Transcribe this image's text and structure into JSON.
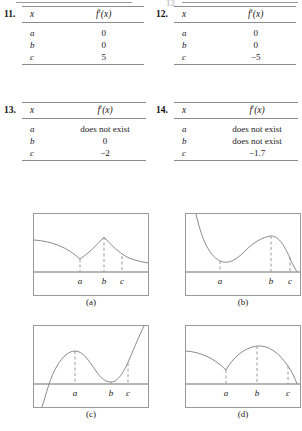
{
  "page": {
    "clipped_top_number": "12"
  },
  "exercises": [
    {
      "number": "11.",
      "columns": [
        "x",
        "f'(x)"
      ],
      "rows": [
        {
          "x": "a",
          "value": "0"
        },
        {
          "x": "b",
          "value": "0"
        },
        {
          "x": "c",
          "value": "5"
        }
      ]
    },
    {
      "number": "12.",
      "columns": [
        "x",
        "f'(x)"
      ],
      "rows": [
        {
          "x": "a",
          "value": "0"
        },
        {
          "x": "b",
          "value": "0"
        },
        {
          "x": "c",
          "value": "−5"
        }
      ]
    },
    {
      "number": "13.",
      "columns": [
        "x",
        "f'(x)"
      ],
      "rows": [
        {
          "x": "a",
          "value": "does not exist"
        },
        {
          "x": "b",
          "value": "0"
        },
        {
          "x": "c",
          "value": "−2"
        }
      ]
    },
    {
      "number": "14.",
      "columns": [
        "x",
        "f'(x)"
      ],
      "rows": [
        {
          "x": "a",
          "value": "does not exist"
        },
        {
          "x": "b",
          "value": "does not exist"
        },
        {
          "x": "c",
          "value": "−1.7"
        }
      ]
    }
  ],
  "figures": [
    {
      "caption": "(a)",
      "tick_labels": [
        "a",
        "b",
        "c"
      ],
      "description": "curve decreasing to a cusp at a, rising to a sharp peak at b, then decreasing through c"
    },
    {
      "caption": "(b)",
      "tick_labels": [
        "a",
        "b",
        "c"
      ],
      "description": "steeply decreasing to a smooth minimum at a, rising to a smooth maximum at b, then falling steeply through c"
    },
    {
      "caption": "(c)",
      "tick_labels": [
        "a",
        "b",
        "c"
      ],
      "description": "rising from below the axis to a smooth maximum at a, falling to a smooth minimum at b on the axis, then rising steeply through c"
    },
    {
      "caption": "(d)",
      "tick_labels": [
        "a",
        "b",
        "c"
      ],
      "description": "curve decreasing to a cusp at a, rising in a smooth arc to a maximum at b, then descending steeply through c"
    }
  ],
  "colors": {
    "curve": "#8a8a8a",
    "rule": "#8c8c8c",
    "axis": "#6f6f6f",
    "frame": "#9a9a9a",
    "text": "#1a1a1a"
  }
}
